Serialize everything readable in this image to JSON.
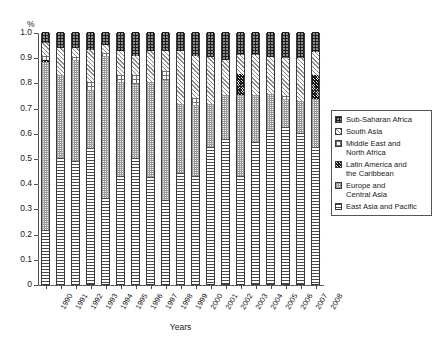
{
  "chart_data": {
    "type": "bar",
    "stacked": true,
    "normalized": true,
    "title": "",
    "xlabel": "Years",
    "ylabel": "%",
    "ylim": [
      0,
      1.0
    ],
    "ytick_labels": [
      "1.0",
      "0.9",
      "0.8",
      "0.7",
      "0.6",
      "0.5",
      "0.4",
      "0.3",
      "0.2",
      "0.1",
      "0"
    ],
    "ytick_values": [
      1.0,
      0.9,
      0.8,
      0.7,
      0.6,
      0.5,
      0.4,
      0.3,
      0.2,
      0.1,
      0.0
    ],
    "grid": true,
    "legend_position": "right",
    "categories": [
      "1990",
      "1991",
      "1992",
      "1993",
      "1994",
      "1995",
      "1996",
      "1997",
      "1998",
      "1999",
      "2000",
      "2001",
      "2002",
      "2003",
      "2004",
      "2005",
      "2006",
      "2007",
      "2008"
    ],
    "series": [
      {
        "name": "East Asia and Pacific",
        "pattern": "horizontal-lines",
        "values": [
          0.215,
          0.5,
          0.49,
          0.54,
          0.34,
          0.43,
          0.5,
          0.425,
          0.335,
          0.44,
          0.43,
          0.545,
          0.575,
          0.43,
          0.565,
          0.61,
          0.625,
          0.6,
          0.545
        ]
      },
      {
        "name": "Europe and Central Asia",
        "pattern": "light-dotted",
        "values": [
          0.665,
          0.33,
          0.4,
          0.23,
          0.565,
          0.37,
          0.295,
          0.375,
          0.475,
          0.275,
          0.28,
          0.17,
          0.175,
          0.32,
          0.185,
          0.145,
          0.11,
          0.125,
          0.19
        ]
      },
      {
        "name": "Latin America and the Caribbean",
        "pattern": "dark-checker",
        "values": [
          0.01,
          0.0,
          0.0,
          0.0,
          0.0,
          0.0,
          0.0,
          0.0,
          0.0,
          0.0,
          0.0,
          0.0,
          0.0,
          0.085,
          0.0,
          0.0,
          0.0,
          0.0,
          0.095
        ]
      },
      {
        "name": "Middle East and North Africa",
        "pattern": "sparse-dots",
        "values": [
          0.015,
          0.0,
          0.01,
          0.03,
          0.01,
          0.03,
          0.035,
          0.0,
          0.035,
          0.0,
          0.03,
          0.0,
          0.0,
          0.0,
          0.0,
          0.0,
          0.01,
          0.0,
          0.0
        ]
      },
      {
        "name": "South Asia",
        "pattern": "diagonal-hatch",
        "values": [
          0.05,
          0.105,
          0.035,
          0.13,
          0.035,
          0.095,
          0.075,
          0.125,
          0.08,
          0.21,
          0.165,
          0.185,
          0.14,
          0.075,
          0.16,
          0.145,
          0.15,
          0.17,
          0.09
        ]
      },
      {
        "name": "Sub-Saharan Africa",
        "pattern": "dark-grid",
        "values": [
          0.045,
          0.065,
          0.065,
          0.07,
          0.05,
          0.075,
          0.095,
          0.075,
          0.075,
          0.075,
          0.095,
          0.1,
          0.11,
          0.09,
          0.09,
          0.1,
          0.105,
          0.105,
          0.08
        ]
      }
    ],
    "legend_entries": [
      {
        "label": "Sub-Saharan Africa",
        "pattern": "dark-grid"
      },
      {
        "label": "South Asia",
        "pattern": "diagonal-hatch"
      },
      {
        "label": "Middle East and\nNorth Africa",
        "pattern": "sparse-dots"
      },
      {
        "label": "Latin America and\nthe Caribbean",
        "pattern": "dark-checker"
      },
      {
        "label": "Europe and\nCentral Asia",
        "pattern": "light-dotted"
      },
      {
        "label": "East Asia and Pacific",
        "pattern": "horizontal-lines"
      }
    ]
  }
}
